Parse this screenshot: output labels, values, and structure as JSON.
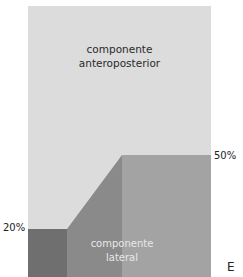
{
  "diagram": {
    "regions": [
      {
        "id": "anteroposterior",
        "label_lines": [
          "componente",
          "anteroposterior"
        ],
        "color": "#dcdcdc"
      },
      {
        "id": "lateral",
        "label_lines": [
          "componente",
          "lateral"
        ],
        "color": "#9a9a9a"
      }
    ],
    "levels": {
      "high": "50%",
      "low": "20%"
    },
    "panel_letter": "E",
    "colors": {
      "background_panel": "#dcdcdc",
      "dark_block": "#6e6e6e",
      "mid_block": "#8c8c8c",
      "right_block": "#a6a6a6"
    }
  }
}
